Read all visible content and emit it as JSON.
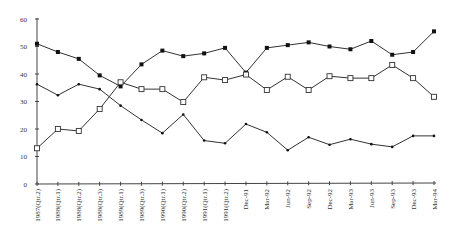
{
  "chart_data": {
    "type": "line",
    "title": "",
    "xlabel": "",
    "ylabel": "",
    "ylim": [
      0,
      60
    ],
    "yticks": [
      0,
      10,
      20,
      30,
      40,
      50,
      60
    ],
    "grid": false,
    "legend": null,
    "categories": [
      "1987(Qtr.2)",
      "1988(Qtr.1)",
      "1988(Qtr.2)",
      "1988(Qtr.3)",
      "1989(Qtr.1)",
      "1989(Qtr.3)",
      "1990(Qtr.1)",
      "1990(Qtr.2)",
      "1991(Qtr.1)",
      "1991(Qtr.2)",
      "Dec-91",
      "Mar-92",
      "Jun-92",
      "Sep-92",
      "Dec-92",
      "Mar-93",
      "Jun-93",
      "Sep-93",
      "Dec-93",
      "Mar-94"
    ],
    "series": [
      {
        "name": "Series 1 (filled squares)",
        "marker": "filled-square",
        "values": [
          51,
          48,
          45.5,
          39.5,
          35.5,
          43.5,
          48.5,
          46.5,
          47.5,
          49.5,
          40.5,
          49.5,
          50.5,
          51.5,
          50,
          49,
          52,
          47,
          48,
          55.5
        ]
      },
      {
        "name": "Series 2 (open squares)",
        "marker": "open-square",
        "values": [
          13,
          20,
          19.3,
          27.3,
          37,
          34.5,
          34.5,
          29.8,
          38.8,
          37.8,
          39.8,
          34.2,
          39,
          34.2,
          39.2,
          38.5,
          38.5,
          43.3,
          38.5,
          31.7
        ]
      },
      {
        "name": "Series 3 (small dots)",
        "marker": "small-dot",
        "values": [
          36.3,
          32.3,
          36.3,
          34.5,
          28.5,
          23.3,
          18.5,
          25.3,
          15.8,
          14.8,
          21.8,
          18.8,
          12.3,
          17,
          14.3,
          16.3,
          14.5,
          13.5,
          17.5,
          17.5
        ]
      }
    ]
  },
  "layout": {
    "x_start": 37,
    "x_end": 434,
    "y_zero": 184,
    "y_top": 19
  }
}
